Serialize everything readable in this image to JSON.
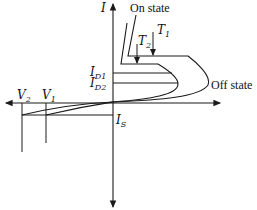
{
  "diagram": {
    "type": "I-V characteristic",
    "axes": {
      "vertical_label": "I",
      "horizontal_label": ""
    },
    "labels": {
      "on_state": "On state",
      "off_state": "Off state",
      "t1": {
        "main": "T",
        "sub": "1"
      },
      "t2": {
        "main": "T",
        "sub": "2"
      },
      "id1": {
        "main": "I",
        "sub": "D1"
      },
      "id2": {
        "main": "I",
        "sub": "D2"
      },
      "is": {
        "main": "I",
        "sub": "S"
      },
      "v1": {
        "main": "V",
        "sub": "1"
      },
      "v2": {
        "main": "V",
        "sub": "2"
      }
    },
    "colors": {
      "stroke": "#1a1a1a",
      "background": "#ffffff"
    }
  }
}
